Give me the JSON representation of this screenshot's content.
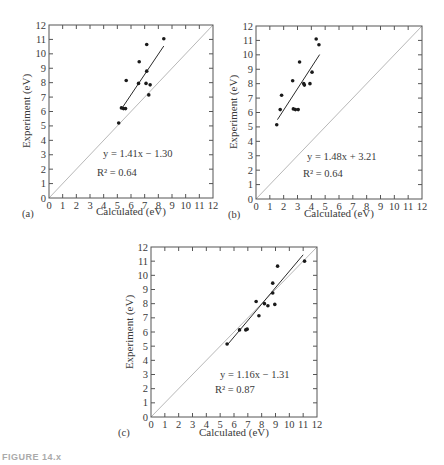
{
  "figure": {
    "caption": "FIGURE 14.x"
  },
  "chart_data": [
    {
      "type": "scatter",
      "panel_label": "(a)",
      "title": "",
      "xlabel": "Calculated (eV)",
      "ylabel": "Experiment (eV)",
      "xlim": [
        0,
        12
      ],
      "ylim": [
        0,
        12
      ],
      "xticks": [
        0,
        1,
        2,
        3,
        4,
        5,
        6,
        7,
        8,
        9,
        10,
        11,
        12
      ],
      "yticks": [
        0,
        1,
        2,
        3,
        4,
        5,
        6,
        7,
        8,
        9,
        10,
        11,
        12
      ],
      "grid": false,
      "reference_line": "y = x",
      "fit_equation": "y = 1.41x − 1.30",
      "r_squared_label": "R² = 0.64",
      "fit": {
        "slope": 1.41,
        "intercept": -1.3,
        "x_range": [
          5.3,
          8.4
        ]
      },
      "points": [
        {
          "x": 5.1,
          "y": 5.2
        },
        {
          "x": 5.3,
          "y": 6.25
        },
        {
          "x": 5.45,
          "y": 6.2
        },
        {
          "x": 5.6,
          "y": 6.2
        },
        {
          "x": 5.65,
          "y": 8.15
        },
        {
          "x": 6.55,
          "y": 7.95
        },
        {
          "x": 6.6,
          "y": 9.45
        },
        {
          "x": 7.15,
          "y": 10.65
        },
        {
          "x": 7.15,
          "y": 8.8
        },
        {
          "x": 7.1,
          "y": 7.95
        },
        {
          "x": 7.4,
          "y": 7.85
        },
        {
          "x": 7.3,
          "y": 7.15
        },
        {
          "x": 8.4,
          "y": 11.05
        }
      ]
    },
    {
      "type": "scatter",
      "panel_label": "(b)",
      "title": "",
      "xlabel": "Calculated (eV)",
      "ylabel": "Experiment (eV)",
      "xlim": [
        0,
        12
      ],
      "ylim": [
        0,
        12
      ],
      "xticks": [
        0,
        1,
        2,
        3,
        4,
        5,
        6,
        7,
        8,
        9,
        10,
        11,
        12
      ],
      "yticks": [
        0,
        1,
        2,
        3,
        4,
        5,
        6,
        7,
        8,
        9,
        10,
        11,
        12
      ],
      "grid": false,
      "reference_line": "y = x",
      "fit_equation": "y = 1.48x + 3.21",
      "r_squared_label": "R² = 0.64",
      "fit": {
        "slope": 1.48,
        "intercept": 3.21,
        "x_range": [
          1.55,
          4.6
        ]
      },
      "points": [
        {
          "x": 1.5,
          "y": 5.15
        },
        {
          "x": 1.75,
          "y": 6.2
        },
        {
          "x": 1.85,
          "y": 7.2
        },
        {
          "x": 2.65,
          "y": 8.2
        },
        {
          "x": 2.7,
          "y": 6.25
        },
        {
          "x": 2.85,
          "y": 6.2
        },
        {
          "x": 3.05,
          "y": 6.2
        },
        {
          "x": 3.15,
          "y": 9.5
        },
        {
          "x": 3.45,
          "y": 8.0
        },
        {
          "x": 3.5,
          "y": 7.9
        },
        {
          "x": 3.9,
          "y": 8.0
        },
        {
          "x": 4.05,
          "y": 8.8
        },
        {
          "x": 4.35,
          "y": 11.1
        },
        {
          "x": 4.55,
          "y": 10.7
        }
      ]
    },
    {
      "type": "scatter",
      "panel_label": "(c)",
      "title": "",
      "xlabel": "Calculated (eV)",
      "ylabel": "Experiment (eV)",
      "xlim": [
        0,
        12
      ],
      "ylim": [
        0,
        12
      ],
      "xticks": [
        0,
        1,
        2,
        3,
        4,
        5,
        6,
        7,
        8,
        9,
        10,
        11,
        12
      ],
      "yticks": [
        0,
        1,
        2,
        3,
        4,
        5,
        6,
        7,
        8,
        9,
        10,
        11,
        12
      ],
      "grid": false,
      "reference_line": "y = x",
      "fit_equation": "y = 1.16x − 1.31",
      "r_squared_label": "R² = 0.87",
      "fit": {
        "slope": 1.16,
        "intercept": -1.31,
        "x_range": [
          5.5,
          11.0
        ]
      },
      "points": [
        {
          "x": 5.5,
          "y": 5.15
        },
        {
          "x": 6.4,
          "y": 6.15
        },
        {
          "x": 6.85,
          "y": 6.15
        },
        {
          "x": 6.95,
          "y": 6.2
        },
        {
          "x": 7.6,
          "y": 8.15
        },
        {
          "x": 7.8,
          "y": 7.15
        },
        {
          "x": 8.2,
          "y": 8.0
        },
        {
          "x": 8.45,
          "y": 7.85
        },
        {
          "x": 8.8,
          "y": 9.45
        },
        {
          "x": 8.8,
          "y": 8.75
        },
        {
          "x": 8.95,
          "y": 7.95
        },
        {
          "x": 9.15,
          "y": 10.65
        },
        {
          "x": 11.1,
          "y": 11.0
        }
      ]
    }
  ],
  "layout": {
    "panels": [
      {
        "frame": {
          "x": 49,
          "y": 25,
          "w": 164,
          "h": 173
        },
        "eq_pos": {
          "x": 103,
          "y": 157
        },
        "r2_pos": {
          "x": 97,
          "y": 176
        },
        "label_pos": {
          "x": 22,
          "y": 217
        },
        "xlabel_pos": {
          "x": 131,
          "y": 215
        },
        "ylabel_pos": {
          "x": 30,
          "y": 111
        }
      },
      {
        "frame": {
          "x": 256,
          "y": 26,
          "w": 166,
          "h": 173
        },
        "eq_pos": {
          "x": 307,
          "y": 160
        },
        "r2_pos": {
          "x": 303,
          "y": 177
        },
        "label_pos": {
          "x": 228,
          "y": 218
        },
        "xlabel_pos": {
          "x": 339,
          "y": 217
        },
        "ylabel_pos": {
          "x": 237,
          "y": 112
        }
      },
      {
        "frame": {
          "x": 151,
          "y": 247,
          "w": 166,
          "h": 170
        },
        "eq_pos": {
          "x": 220,
          "y": 378
        },
        "r2_pos": {
          "x": 215,
          "y": 393
        },
        "label_pos": {
          "x": 118,
          "y": 436
        },
        "xlabel_pos": {
          "x": 234,
          "y": 436
        },
        "ylabel_pos": {
          "x": 133,
          "y": 332
        }
      }
    ]
  },
  "colors": {
    "axis": "#555555",
    "points": "#1a1a1a",
    "fit_line": "#2a2a2a",
    "reference_line": "#b8b8b8",
    "text": "#3a3a3a"
  }
}
